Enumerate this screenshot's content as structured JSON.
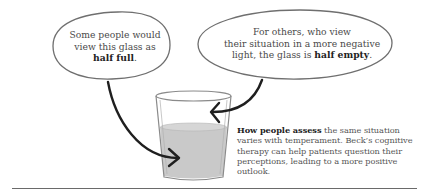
{
  "bubble_left": {
    "line1": "Some people would",
    "line2": "view this glass as",
    "emphasis": "half full",
    "end": "."
  },
  "bubble_right": {
    "line1": "For others, who view",
    "line2": "their situation in a more negative",
    "line3_pre": "light, the glass is ",
    "emphasis": "half empty",
    "end": "."
  },
  "caption": {
    "lead": "How people assess",
    "body": " the same situation varies with temperament. Beck’s cognitive therapy can help patients question their perceptions, leading to a more positive outlook."
  },
  "illustration": {
    "subject": "glass-of-water",
    "liquid_level": "half",
    "colors": {
      "liquid": "#c9c9c9",
      "outline": "#8a8a8a",
      "arrow": "#1f1f1f",
      "bubble_outline": "#6f6f6f"
    }
  }
}
